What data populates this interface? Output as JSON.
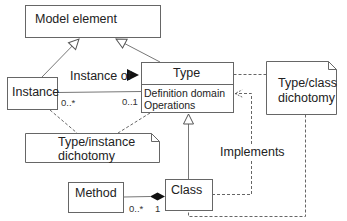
{
  "diagram": {
    "type": "UML class diagram",
    "classes": {
      "model_element": {
        "name": "Model element"
      },
      "instance": {
        "name": "Instance"
      },
      "type": {
        "name": "Type",
        "attributes": [
          "Definition domain",
          "Operations"
        ]
      },
      "method": {
        "name": "Method"
      },
      "class": {
        "name": "Class"
      }
    },
    "notes": {
      "type_instance": {
        "line1": "Type/instance",
        "line2": "dichotomy"
      },
      "type_class": {
        "line1": "Type/class",
        "line2": "dichotomy"
      }
    },
    "associations": {
      "instance_of": {
        "label": "Instance of",
        "direction_icon": "triangle-right-icon",
        "source_multiplicity": "0..*",
        "target_multiplicity": "0..1"
      },
      "method_class": {
        "kind": "composition",
        "source_multiplicity": "0..*",
        "target_multiplicity": "1"
      }
    },
    "realization": {
      "label": "Implements"
    },
    "generalizations": [
      {
        "from": "Instance",
        "to": "Model element"
      },
      {
        "from": "Type",
        "to": "Model element"
      },
      {
        "from": "Class",
        "to": "Type"
      }
    ],
    "colors": {
      "line": "#555555",
      "text": "#222222",
      "background": "#ffffff"
    }
  }
}
